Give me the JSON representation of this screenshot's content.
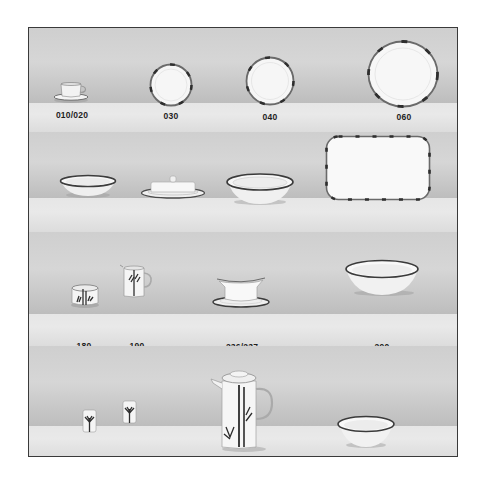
{
  "catalog": {
    "colors": {
      "frame_border": "#3a3a3a",
      "backdrop": "#d3d3d3",
      "ledge": "#e6e6e6",
      "porcelain": "#f7f7f7",
      "rim_band": "#3c3c3c",
      "label_text": "#1e1e1e"
    },
    "shelves": [
      {
        "items": [
          {
            "number": "010/020",
            "icon": "cup-and-saucer-icon"
          },
          {
            "number": "030",
            "icon": "small-plate-icon"
          },
          {
            "number": "040",
            "icon": "medium-plate-icon"
          },
          {
            "number": "060",
            "icon": "large-plate-icon"
          }
        ]
      },
      {
        "items": [
          {
            "number": "070",
            "icon": "soup-bowl-icon"
          },
          {
            "number": "130",
            "icon": "butter-dish-icon"
          },
          {
            "number": "150",
            "icon": "deep-bowl-icon"
          },
          {
            "number": "170",
            "icon": "rectangular-platter-icon"
          }
        ]
      },
      {
        "items": [
          {
            "number": "180",
            "icon": "sugar-bowl-icon"
          },
          {
            "number": "190",
            "icon": "creamer-icon"
          },
          {
            "number": "236/237",
            "icon": "gravy-boat-icon"
          },
          {
            "number": "290",
            "icon": "salad-bowl-icon"
          }
        ]
      },
      {
        "items": [
          {
            "number": "330",
            "icon": "salt-shaker-icon"
          },
          {
            "number": "340",
            "icon": "pepper-shaker-icon"
          },
          {
            "number": "400",
            "icon": "coffee-pot-icon"
          },
          {
            "number": "420",
            "icon": "small-bowl-icon"
          }
        ]
      }
    ]
  }
}
